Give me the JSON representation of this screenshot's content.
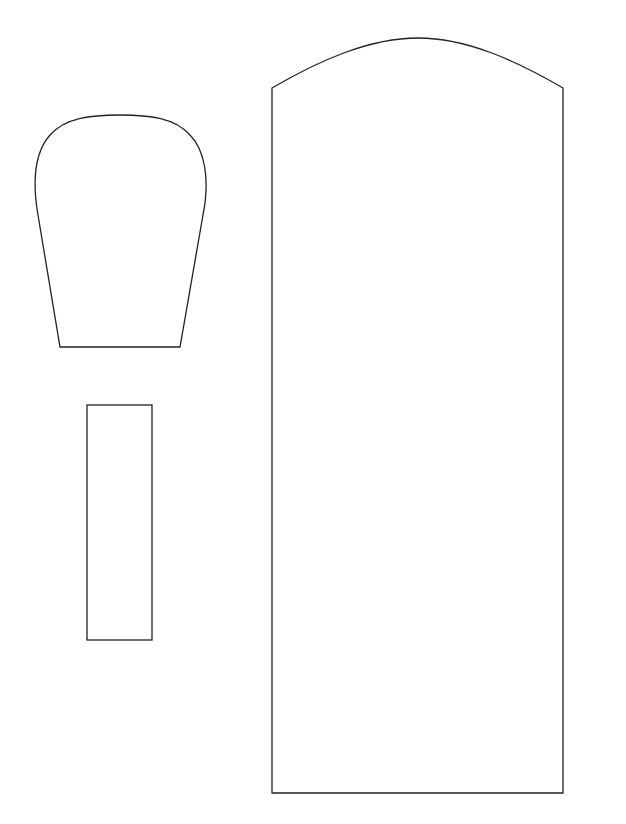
{
  "canvas": {
    "width": 626,
    "height": 824,
    "background": "#ffffff",
    "stroke": "#222222"
  },
  "shapes": [
    {
      "name": "rounded-top-trapezoid",
      "path": "M60 347 L180 347 L203 215 C210 180 205 150 190 135 C175 118 150 115 120 115 C90 115 65 118 50 135 C35 152 32 180 38 215 Z"
    },
    {
      "name": "narrow-rectangle",
      "x": 87,
      "y": 405,
      "width": 65,
      "height": 235
    },
    {
      "name": "arched-tall-panel",
      "path": "M272 793 L272 88 C320 60 370 38 418 38 C466 38 515 60 563 88 L563 793 Z"
    }
  ]
}
